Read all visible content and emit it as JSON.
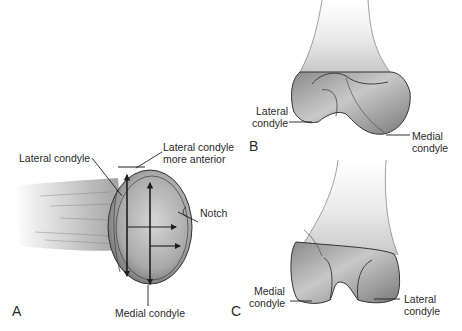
{
  "figure": {
    "panels": [
      {
        "id": "A",
        "letter": "A",
        "view": "inferior view of distal femur (condyles end-on)",
        "labels": {
          "lateral_condyle": "Lateral condyle",
          "lateral_anterior_line1": "Lateral condyle",
          "lateral_anterior_line2": "more anterior",
          "notch": "Notch",
          "medial_condyle": "Medial condyle"
        }
      },
      {
        "id": "B",
        "letter": "B",
        "view": "lateral-oblique view of distal femur",
        "labels": {
          "lateral_line1": "Lateral",
          "lateral_line2": "condyle",
          "medial_line1": "Medial",
          "medial_line2": "condyle"
        }
      },
      {
        "id": "C",
        "letter": "C",
        "view": "posterior view of distal femur",
        "labels": {
          "medial_line1": "Medial",
          "medial_line2": "condyle",
          "lateral_line1": "Lateral",
          "lateral_line2": "condyle"
        }
      }
    ],
    "colors": {
      "background": "#ffffff",
      "bone_light": "#e9e9e9",
      "bone_mid": "#b5b5b5",
      "bone_dark": "#555555",
      "line": "#1e1e1e"
    }
  }
}
